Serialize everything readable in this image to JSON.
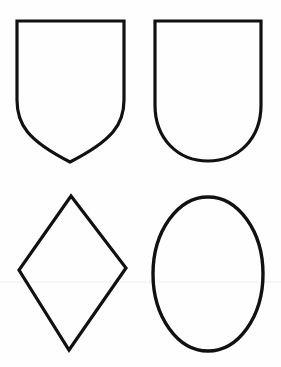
{
  "figure": {
    "width": 281,
    "height": 367,
    "background": "#fefefe",
    "stroke_color": "#111111",
    "stroke_width": 3.2,
    "shapes": [
      {
        "id": "shield-pointed",
        "kind": "heater-shield",
        "description": "Shield with flat top, straight sides, curving to a pointed base",
        "bbox": [
          17,
          21,
          124,
          162
        ]
      },
      {
        "id": "shield-rounded",
        "kind": "rounded-shield",
        "description": "Shield with flat top, straight sides, and a rounded base",
        "bbox": [
          155,
          21,
          261,
          161
        ]
      },
      {
        "id": "lozenge",
        "kind": "diamond",
        "description": "Lozenge / diamond shape",
        "points": [
          [
            71,
            196
          ],
          [
            126,
            268
          ],
          [
            69,
            350
          ],
          [
            19,
            270
          ]
        ]
      },
      {
        "id": "oval",
        "kind": "ellipse",
        "description": "Vertical oval",
        "cx": 208,
        "cy": 274,
        "rx": 55,
        "ry": 77
      }
    ],
    "scan_line": {
      "y": 282,
      "color": "#eeeeee"
    }
  }
}
